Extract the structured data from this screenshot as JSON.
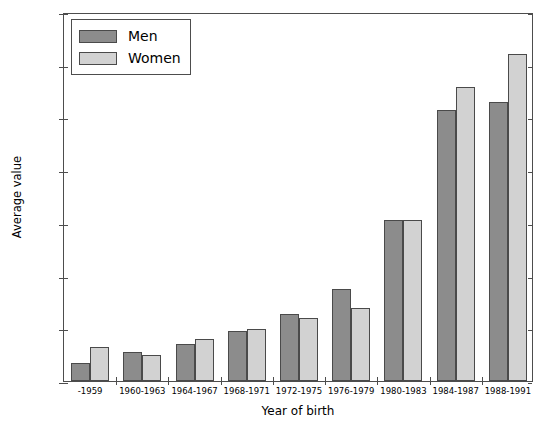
{
  "chart_data": {
    "type": "bar",
    "title": "",
    "xlabel": "Year of birth",
    "ylabel": "Average value",
    "categories": [
      "-1959",
      "1960-1963",
      "1964-1967",
      "1968-1971",
      "1972-1975",
      "1976-1979",
      "1980-1983",
      "1984-1987",
      "1988-1991"
    ],
    "series": [
      {
        "name": "Men",
        "color": "#8c8c8c",
        "values": [
          0.0035,
          0.0055,
          0.007,
          0.0095,
          0.0127,
          0.0174,
          0.0306,
          0.0515,
          0.053
        ]
      },
      {
        "name": "Women",
        "color": "#d2d2d2",
        "values": [
          0.0065,
          0.005,
          0.008,
          0.0099,
          0.012,
          0.0138,
          0.0306,
          0.0557,
          0.062
        ]
      }
    ],
    "ylim": [
      0.0,
      0.07
    ],
    "yticks": [
      0.0,
      0.01,
      0.02,
      0.03,
      0.04,
      0.05,
      0.06,
      0.07
    ],
    "ytick_labels": [
      "0.00",
      "0.01",
      "0.02",
      "0.03",
      "0.04",
      "0.05",
      "0.06",
      "0.07"
    ],
    "grid": false,
    "legend_position": "upper left"
  },
  "legend": {
    "entries": [
      {
        "label": "Men"
      },
      {
        "label": "Women"
      }
    ]
  },
  "axes": {
    "y_title": "Average value",
    "x_title": "Year of birth"
  }
}
